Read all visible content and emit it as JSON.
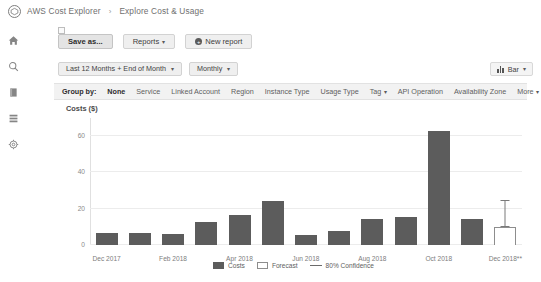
{
  "header": {
    "logo_icon": "aws-cube-icon",
    "app_title": "AWS Cost Explorer",
    "separator": "›",
    "page_title": "Explore Cost & Usage"
  },
  "sidebar": {
    "items": [
      {
        "icon": "home-icon",
        "name": "home"
      },
      {
        "icon": "search-icon",
        "name": "search"
      },
      {
        "icon": "book-icon",
        "name": "reports"
      },
      {
        "icon": "list-icon",
        "name": "list"
      },
      {
        "icon": "gear-icon",
        "name": "settings"
      }
    ]
  },
  "toolbar": {
    "save_as_label": "Save as...",
    "reports_label": "Reports",
    "reports_caret": "▾",
    "new_report_label": "New report",
    "new_report_icon": "plus-circle-icon",
    "plus_glyph": "+"
  },
  "filters": {
    "date_range_label": "Last 12 Months + End of Month",
    "date_range_caret": "▾",
    "granularity_label": "Monthly",
    "granularity_caret": "▾",
    "chart_type_label": "Bar",
    "chart_type_caret": "▾",
    "chart_type_icon": "bar-chart-icon"
  },
  "group_by": {
    "label": "Group by:",
    "selected": "None",
    "items": [
      {
        "label": "None",
        "selected": true,
        "caret": ""
      },
      {
        "label": "Service",
        "selected": false,
        "caret": ""
      },
      {
        "label": "Linked Account",
        "selected": false,
        "caret": ""
      },
      {
        "label": "Region",
        "selected": false,
        "caret": ""
      },
      {
        "label": "Instance Type",
        "selected": false,
        "caret": ""
      },
      {
        "label": "Usage Type",
        "selected": false,
        "caret": ""
      },
      {
        "label": "Tag",
        "selected": false,
        "caret": "▾"
      },
      {
        "label": "API Operation",
        "selected": false,
        "caret": ""
      },
      {
        "label": "Availability Zone",
        "selected": false,
        "caret": ""
      }
    ],
    "more_label": "More",
    "more_caret": "▾"
  },
  "chart_data": {
    "type": "bar",
    "title": "Costs ($)",
    "xlabel": "",
    "ylabel": "Costs ($)",
    "ylim": [
      0,
      70
    ],
    "yticks": [
      0,
      20,
      40,
      60
    ],
    "ytick_labels": [
      "0",
      "20",
      "40",
      "60"
    ],
    "grid": true,
    "legend_position": "bottom",
    "categories": [
      "Dec 2017",
      "Jan 2018",
      "Feb 2018",
      "Mar 2018",
      "Apr 2018",
      "May 2018",
      "Jun 2018",
      "Jul 2018",
      "Aug 2018",
      "Sep 2018",
      "Oct 2018",
      "Nov 2018",
      "Dec 2018**"
    ],
    "tick_labels": [
      "Dec 2017",
      "",
      "Feb 2018",
      "",
      "Apr 2018",
      "",
      "Jun 2018",
      "",
      "Aug 2018",
      "",
      "Oct 2018",
      "",
      "Dec 2018**"
    ],
    "series": [
      {
        "name": "Costs",
        "color": "#5c5c5c",
        "values": [
          6.5,
          6.5,
          6.0,
          12.5,
          16.5,
          24.5,
          5.5,
          8.0,
          14.5,
          15.5,
          63.0,
          14.5,
          null
        ]
      },
      {
        "name": "Forecast",
        "color": "#ffffff",
        "values": [
          null,
          null,
          null,
          null,
          null,
          null,
          null,
          null,
          null,
          null,
          null,
          null,
          10.0
        ]
      }
    ],
    "confidence": {
      "name": "80% Confidence",
      "color": "#7a7a7a",
      "index": 12,
      "low": 10.0,
      "high": 25.0
    },
    "legend": [
      {
        "label": "Costs",
        "swatch": "costs"
      },
      {
        "label": "Forecast",
        "swatch": "forecast"
      },
      {
        "label": "80% Confidence",
        "swatch": "conf"
      }
    ]
  }
}
